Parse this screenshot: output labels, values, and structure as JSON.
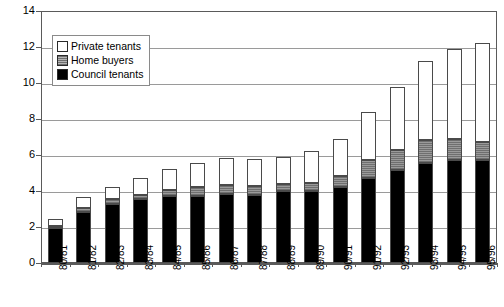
{
  "chart_data": {
    "type": "bar",
    "stacked": true,
    "title": "",
    "xlabel": "",
    "ylabel": "£ billion (1993 prices)",
    "ylim": [
      0,
      14
    ],
    "ytick_step": 2,
    "yticks": [
      "0",
      "2",
      "4",
      "6",
      "8",
      "10",
      "12",
      "14"
    ],
    "grid": true,
    "legend_position": "upper-left-inside",
    "categories": [
      "80/81",
      "81/82",
      "82/83",
      "83/84",
      "84/85",
      "85/86",
      "86/87",
      "87/88",
      "88/89",
      "89/90",
      "90/91",
      "91/92",
      "92/93",
      "93/94",
      "94/95",
      "95/96"
    ],
    "series": [
      {
        "name": "Council tenants",
        "color": "#000000",
        "values": [
          1.95,
          2.85,
          3.3,
          3.55,
          3.7,
          3.75,
          3.85,
          3.8,
          4.0,
          4.0,
          4.25,
          4.7,
          5.15,
          5.55,
          5.75,
          5.75
        ]
      },
      {
        "name": "Home buyers",
        "color": "#8a8a8a",
        "values": [
          0.1,
          0.2,
          0.25,
          0.25,
          0.35,
          0.45,
          0.5,
          0.5,
          0.4,
          0.45,
          0.6,
          1.05,
          1.15,
          1.3,
          1.15,
          1.0
        ]
      },
      {
        "name": "Private tenants",
        "color": "#ffffff",
        "values": [
          0.4,
          0.6,
          0.7,
          0.95,
          1.15,
          1.35,
          1.5,
          1.5,
          1.5,
          1.8,
          2.05,
          2.65,
          3.5,
          4.35,
          5.0,
          5.45
        ]
      }
    ],
    "totals": [
      2.45,
      3.65,
      4.25,
      4.75,
      5.2,
      5.55,
      5.85,
      5.8,
      5.9,
      6.25,
      6.9,
      8.4,
      9.8,
      11.2,
      11.9,
      12.2
    ]
  },
  "legend": {
    "items": [
      {
        "label": "Private tenants",
        "swatch": "private-swatch"
      },
      {
        "label": "Home buyers",
        "swatch": "home-swatch"
      },
      {
        "label": "Council tenants",
        "swatch": "council-swatch"
      }
    ]
  }
}
